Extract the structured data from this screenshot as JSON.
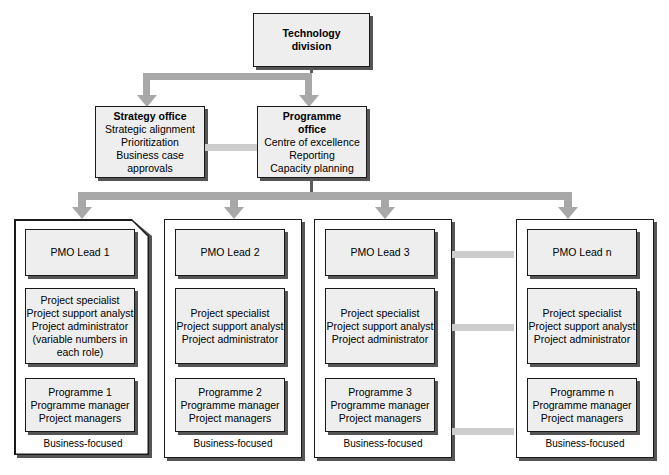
{
  "diagram": {
    "title_node": {
      "id": "technology-division",
      "lines": [
        "Technology",
        "division"
      ],
      "bold": [
        true,
        true
      ]
    },
    "level2": [
      {
        "id": "strategy-office",
        "lines": [
          "Strategy office",
          "Strategic alignment",
          "Prioritization",
          "Business case",
          "approvals"
        ],
        "bold": [
          true,
          false,
          false,
          false,
          false
        ]
      },
      {
        "id": "programme-office",
        "lines": [
          "Programme",
          "office",
          "Centre of excellence",
          "Reporting",
          "Capacity planning"
        ],
        "bold": [
          true,
          true,
          false,
          false,
          false
        ]
      }
    ],
    "columns": [
      {
        "id": "pmo-column-1",
        "lead": {
          "label": "PMO Lead 1",
          "italic_suffix": ""
        },
        "staff": [
          "Project specialist",
          "Project support analyst",
          "Project administrator",
          "(variable numbers in",
          "each role)"
        ],
        "programme": [
          "Programme 1",
          "Programme manager",
          "Project managers"
        ],
        "caption": "Business-focused"
      },
      {
        "id": "pmo-column-2",
        "lead": {
          "label": "PMO Lead 2",
          "italic_suffix": ""
        },
        "staff": [
          "Project specialist",
          "Project support analyst",
          "Project administrator"
        ],
        "programme": [
          "Programme 2",
          "Programme manager",
          "Project managers"
        ],
        "caption": "Business-focused"
      },
      {
        "id": "pmo-column-3",
        "lead": {
          "label": "PMO Lead 3",
          "italic_suffix": ""
        },
        "staff": [
          "Project specialist",
          "Project support analyst",
          "Project administrator"
        ],
        "programme": [
          "Programme 3",
          "Programme manager",
          "Project managers"
        ],
        "caption": "Business-focused"
      },
      {
        "id": "pmo-column-n",
        "lead": {
          "label": "PMO Lead ",
          "italic_suffix": "n"
        },
        "staff": [
          "Project specialist",
          "Project support analyst",
          "Project administrator"
        ],
        "programme_prefix": "Programme ",
        "programme_italic": "n",
        "programme": [
          "Programme n",
          "Programme manager",
          "Project managers"
        ],
        "caption": "Business-focused"
      }
    ],
    "colors": {
      "box_fill": "#eeeeee",
      "box_border": "#1a1a1a",
      "box_shadow": "#555555",
      "connector": "#a8a8a8",
      "connector_light": "#cdcdcd",
      "stem": "#5c5c5c",
      "background": "#ffffff"
    }
  }
}
